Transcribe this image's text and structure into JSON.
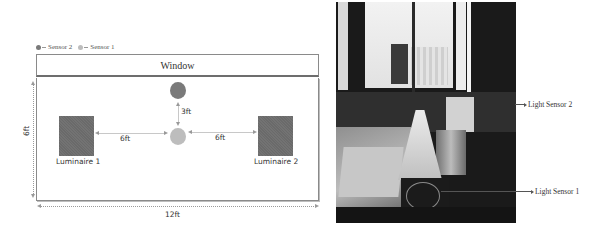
{
  "legend": {
    "items": [
      {
        "label": "Sensor 2",
        "color": "#7a7a7a"
      },
      {
        "label": "Sensor 1",
        "color": "#bdbdbd"
      }
    ]
  },
  "diagram": {
    "window_label": "Window",
    "sensor2_to_sensor1": "3ft",
    "luminaire1_to_sensor1": "6ft",
    "sensor1_to_luminaire2": "6ft",
    "room_width": "12ft",
    "room_depth": "6ft",
    "luminaires": [
      {
        "label": "Luminaire 1"
      },
      {
        "label": "Luminaire 2"
      }
    ]
  },
  "photo": {
    "callouts": [
      {
        "label": "Light Sensor 2"
      },
      {
        "label": "Light Sensor 1"
      }
    ]
  }
}
